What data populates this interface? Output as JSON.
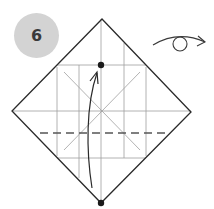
{
  "step": {
    "number": "6",
    "badge_color": "#d3d3d3"
  },
  "symbols": {
    "turn_over": "turn-over-icon"
  },
  "diagram": {
    "square_vertices": {
      "top": [
        102,
        19
      ],
      "right": [
        191,
        112
      ],
      "bottom": [
        101,
        203
      ],
      "left": [
        12,
        111
      ]
    },
    "line_color": "#2a2a2a",
    "crease_color": "#9a9a9a",
    "dashed_valley_fold_y": 133,
    "dots": [
      [
        101,
        65
      ],
      [
        101,
        203
      ]
    ],
    "arrow": "bottom-corner-to-dot"
  }
}
